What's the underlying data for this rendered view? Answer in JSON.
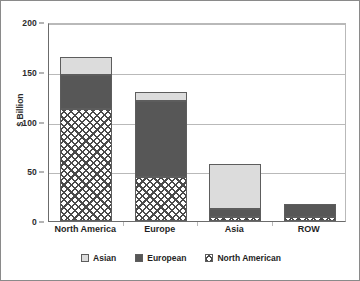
{
  "chart_data": {
    "type": "bar",
    "stacked": true,
    "title": "",
    "subtitle": "",
    "xlabel": "",
    "ylabel": "$ Billion",
    "categories": [
      "North America",
      "Europe",
      "Asia",
      "ROW"
    ],
    "series": [
      {
        "name": "North American",
        "values": [
          113,
          44,
          4,
          4
        ],
        "color": "#ffffff",
        "pattern": "checkered"
      },
      {
        "name": "European",
        "values": [
          34,
          77,
          8,
          13
        ],
        "color": "#575757",
        "pattern": "solid-dark"
      },
      {
        "name": "Asian",
        "values": [
          18,
          9,
          45,
          0
        ],
        "color": "#dcdcdc",
        "pattern": "solid-light"
      }
    ],
    "stack_totals": [
      165,
      130,
      57,
      17
    ],
    "ylim": [
      0,
      200
    ],
    "yticks": [
      0,
      50,
      100,
      150,
      200
    ],
    "ytick_labels": [
      "0",
      "50",
      "100",
      "150",
      "200"
    ],
    "grid": true,
    "grid_axis": "y",
    "legend_position": "bottom",
    "legend_order": [
      "Asian",
      "European",
      "North American"
    ]
  },
  "legend": {
    "items": [
      {
        "label": "Asian",
        "swatch": "legend-swatch-asian"
      },
      {
        "label": "European",
        "swatch": "legend-swatch-european"
      },
      {
        "label": "North American",
        "swatch": "legend-swatch-north-american"
      }
    ]
  }
}
